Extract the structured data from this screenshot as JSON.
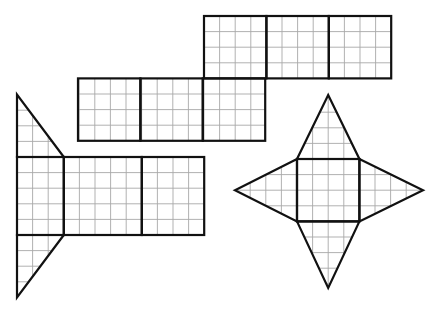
{
  "figure": {
    "grid_unit_px": 15.6,
    "colors": {
      "outline": "#111111",
      "grid": "#a8a8a8",
      "background": "#ffffff"
    },
    "nets": [
      {
        "id": "prism-net-rectangles",
        "label": "Net of rectangular prism (two rows of three 4x4 blocks)",
        "rects": [
          {
            "x": 204,
            "y": 16,
            "w": 62.4,
            "h": 62.4
          },
          {
            "x": 266.4,
            "y": 16,
            "w": 62.4,
            "h": 62.4
          },
          {
            "x": 328.8,
            "y": 16,
            "w": 62.4,
            "h": 62.4
          },
          {
            "x": 78,
            "y": 78.4,
            "w": 62.4,
            "h": 62.4
          },
          {
            "x": 140.4,
            "y": 78.4,
            "w": 62.4,
            "h": 62.4
          },
          {
            "x": 202.8,
            "y": 78.4,
            "w": 62.4,
            "h": 62.4
          }
        ]
      },
      {
        "id": "triangular-prism-net",
        "label": "Net of triangular prism (3 rectangles with 2 right triangles)",
        "rects": [
          {
            "x": 17,
            "y": 157,
            "w": 46.8,
            "h": 78
          },
          {
            "x": 63.8,
            "y": 157,
            "w": 78,
            "h": 78
          },
          {
            "x": 141.8,
            "y": 157,
            "w": 62.4,
            "h": 78
          }
        ],
        "triangles": [
          [
            [
              17,
              94.6
            ],
            [
              17,
              157
            ],
            [
              63.8,
              157
            ]
          ],
          [
            [
              17,
              235
            ],
            [
              63.8,
              235
            ],
            [
              17,
              297.4
            ]
          ]
        ]
      },
      {
        "id": "square-pyramid-net",
        "label": "Net of square pyramid (square with four triangles)",
        "square": {
          "x": 297,
          "y": 159,
          "w": 62.4,
          "h": 62.4
        },
        "triangles": [
          [
            [
              297,
              159
            ],
            [
              328.2,
              95
            ],
            [
              359.4,
              159
            ]
          ],
          [
            [
              297,
              221.4
            ],
            [
              328.2,
              288
            ],
            [
              359.4,
              221.4
            ]
          ],
          [
            [
              297,
              159
            ],
            [
              235,
              190.2
            ],
            [
              297,
              221.4
            ]
          ],
          [
            [
              359.4,
              159
            ],
            [
              423,
              190.2
            ],
            [
              359.4,
              221.4
            ]
          ]
        ]
      }
    ]
  }
}
